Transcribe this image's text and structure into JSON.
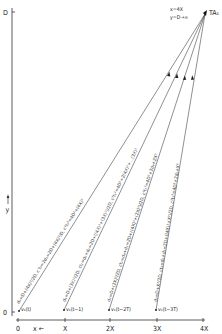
{
  "axes": {
    "y_top_label": "D",
    "y_bottom_label": "0",
    "y_axis_label": "y",
    "x_axis_label": "x ←",
    "x_ticks": [
      "0",
      "X",
      "2X",
      "3X",
      "4X"
    ]
  },
  "apex": {
    "label": "TA₁",
    "coord_x": "x=4X",
    "coord_y": "y=D→∞"
  },
  "lines": [
    {
      "source_label": "v₁(t)",
      "formula": "d₀=D+(4X)²/2D,  c't₀=2d₀=2D+(4X)²/D,  c²t₀²=4D²+(4X)²"
    },
    {
      "source_label": "v₁(t−1)",
      "formula": "d₁=D+(3X)²/2D,  ct₁=d₀+d₁=2D+((4X)²+(3X)²)/2D,  c²t₁²=4D²+2(4X)²+...(3X)²"
    },
    {
      "source_label": "v₁(t−2T)",
      "formula": "d₂=D+(2X)²/2D,  ct₂=d₀+d₂=2D+((4X)²+(2X)²)/2D,  c²t₂²=4D²+2d₀+2X²"
    },
    {
      "source_label": "v₁(t−3T)",
      "formula": "d₃=D+X²/2D,  ct₃=d₀+d₃=2D+((4X)²+X²)/2D,  c²t₃²=4D²+2d₀+X²"
    }
  ]
}
